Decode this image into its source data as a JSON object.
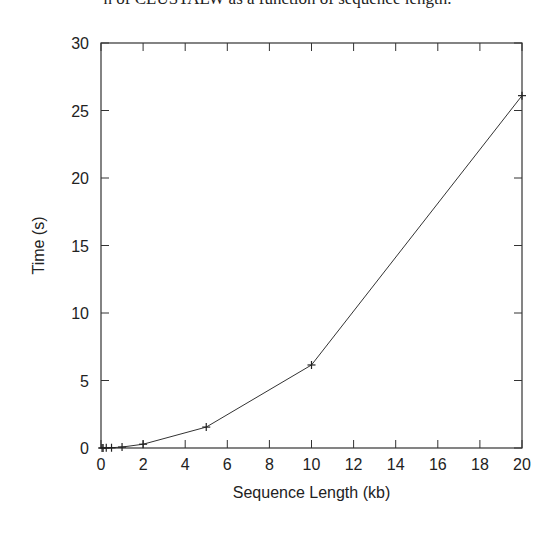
{
  "caption": "n of CLUSTALW as a function of sequence length.",
  "chart_data": {
    "type": "line",
    "title": "",
    "xlabel": "Sequence Length (kb)",
    "ylabel": "Time (s)",
    "xlim": [
      0,
      20
    ],
    "ylim": [
      0,
      30
    ],
    "xticks": [
      0,
      2,
      4,
      6,
      8,
      10,
      12,
      14,
      16,
      18,
      20
    ],
    "yticks": [
      0,
      5,
      10,
      15,
      20,
      25,
      30
    ],
    "grid": false,
    "legend": null,
    "marker": "+",
    "series": [
      {
        "name": "CLUSTALW",
        "x": [
          0.05,
          0.1,
          0.25,
          0.5,
          1,
          2,
          5,
          10,
          20
        ],
        "y": [
          0.0,
          0.0,
          0.01,
          0.02,
          0.07,
          0.28,
          1.55,
          6.15,
          26.1
        ]
      }
    ]
  }
}
